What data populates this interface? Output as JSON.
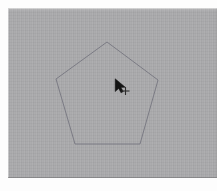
{
  "app": {
    "title": "Pentagon Drawing Canvas",
    "window_kind": "drawing-canvas",
    "canvas_label": "drawing canvas"
  },
  "canvas": {
    "background_color": "#a9a9ab",
    "matte_color": "#fdfdfd",
    "width": 209,
    "height": 170,
    "offset_x": 8,
    "offset_y": 8,
    "texture": "vertical-scanlines"
  },
  "shapes": [
    {
      "name": "pentagon",
      "type": "polygon",
      "sides": 5,
      "stroke_color": "#7b7b84",
      "stroke_width": 1,
      "fill": "none",
      "points": "99,34 48,71 67,136 132,136 150,72",
      "vertices": [
        {
          "label": "apex",
          "x": 99,
          "y": 34
        },
        {
          "label": "upper-left",
          "x": 48,
          "y": 71
        },
        {
          "label": "lower-left",
          "x": 67,
          "y": 136
        },
        {
          "label": "lower-right",
          "x": 132,
          "y": 136
        },
        {
          "label": "upper-right",
          "x": 150,
          "y": 72
        }
      ]
    }
  ],
  "cursor": {
    "name": "arrow-with-crosshair",
    "type": "pointer",
    "x": 114,
    "y": 78,
    "arrow_color": "#141414",
    "crosshair_color": "#2c2c2c",
    "crosshair_offset_x": 11,
    "crosshair_offset_y": 11
  }
}
